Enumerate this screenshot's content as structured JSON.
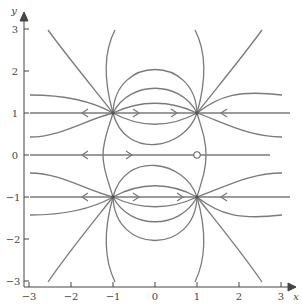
{
  "figure": {
    "type": "phase-portrait",
    "xlabel": "x",
    "ylabel": "y",
    "xlim": [
      -3,
      3
    ],
    "ylim": [
      -3,
      3
    ],
    "x_ticks": [
      "-3",
      "-2",
      "-1",
      "0",
      "1",
      "2",
      "3"
    ],
    "y_ticks": [
      "3",
      "2",
      "1",
      "0",
      "-1",
      "-2",
      "-3"
    ],
    "colors": {
      "curve": "#777777",
      "axis": "#444444",
      "text": "#444444"
    }
  },
  "equilibria": [
    {
      "x": -1,
      "y": 1,
      "kind": "unstable node (source)"
    },
    {
      "x": 1,
      "y": 1,
      "kind": "stable node (sink)"
    },
    {
      "x": -1,
      "y": -1,
      "kind": "unstable node (source)"
    },
    {
      "x": 1,
      "y": -1,
      "kind": "stable node (sink)"
    },
    {
      "x": 1,
      "y": 0,
      "kind": "open circle (degenerate point)"
    }
  ]
}
